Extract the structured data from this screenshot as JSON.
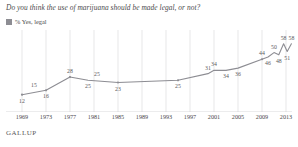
{
  "title": "Do you think the use of marijuana should be made legal, or not?",
  "legend": {
    "label": "% Yes, legal",
    "color": "#8d8d93"
  },
  "footer": "GALLUP",
  "chart_data": {
    "type": "line",
    "title": "Do you think the use of marijuana should be made legal, or not?",
    "xlabel": "",
    "ylabel": "",
    "ylim": [
      0,
      65
    ],
    "xlim": [
      1969,
      2014
    ],
    "grid": "vertical",
    "legend_position": "top-left",
    "series": [
      {
        "name": "% Yes, legal",
        "color": "#8d8d93",
        "points": [
          {
            "x": 1969,
            "y": 12,
            "label": "12",
            "label_pos": "below"
          },
          {
            "x": 1973,
            "y": 16,
            "label": "16",
            "label_pos": "below"
          },
          {
            "x": 1977,
            "y": 28,
            "label": "28",
            "label_pos": "above"
          },
          {
            "x": 1980,
            "y": 25,
            "label": "25",
            "label_pos": "below"
          },
          {
            "x": 1985,
            "y": 23,
            "label": "23",
            "label_pos": "below"
          },
          {
            "x": 1995,
            "y": 25,
            "label": "25",
            "label_pos": "below"
          },
          {
            "x": 2000,
            "y": 31,
            "label": "31",
            "label_pos": "above"
          },
          {
            "x": 2001,
            "y": 34,
            "label": "34",
            "label_pos": "above"
          },
          {
            "x": 2003,
            "y": 34,
            "label": "34",
            "label_pos": "below"
          },
          {
            "x": 2005,
            "y": 36,
            "label": "36",
            "label_pos": "below"
          },
          {
            "x": 2009,
            "y": 44,
            "label": "44",
            "label_pos": "above"
          },
          {
            "x": 2010,
            "y": 46,
            "label": "46",
            "label_pos": "below"
          },
          {
            "x": 2011,
            "y": 50,
            "label": "50",
            "label_pos": "above"
          },
          {
            "x": 2011.8,
            "y": 48,
            "label": "48",
            "label_pos": "below"
          },
          {
            "x": 2012.6,
            "y": 58,
            "label": "58",
            "label_pos": "above"
          },
          {
            "x": 2013.2,
            "y": 51,
            "label": "51",
            "label_pos": "below"
          },
          {
            "x": 2013.9,
            "y": 58,
            "label": "58",
            "label_pos": "above"
          }
        ],
        "extra_labels": [
          {
            "x": 1971,
            "y": 15,
            "label": "15"
          },
          {
            "x": 1981.5,
            "y": 25,
            "label": "25"
          }
        ]
      }
    ],
    "xticks": [
      1969,
      1973,
      1977,
      1981,
      1985,
      1989,
      1993,
      1997,
      2001,
      2005,
      2009,
      2013
    ]
  }
}
